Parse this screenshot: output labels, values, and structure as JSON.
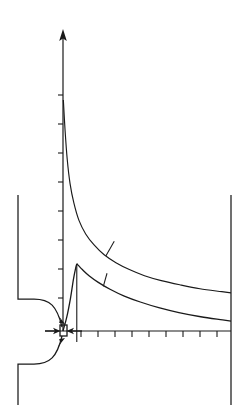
{
  "figure": {
    "title": "",
    "background_color": "#ffffff",
    "ink_color": "#1a1a1a",
    "width": 251,
    "height": 419
  },
  "chart_data": {
    "type": "line",
    "title": "",
    "subtitle": "",
    "xlabel": "",
    "ylabel": "",
    "xlim": [
      0,
      10
    ],
    "ylim": [
      0,
      10
    ],
    "grid": false,
    "legend_position": "none",
    "axes": {
      "origin_px": [
        63,
        331
      ],
      "y_axis": {
        "arrow": true,
        "tick_count": 8,
        "tick_values": [
          1,
          2,
          3,
          4,
          5,
          6,
          7,
          8
        ],
        "tick_labels": []
      },
      "x_axis": {
        "arrow": false,
        "tick_count": 9,
        "tick_values": [
          1,
          2,
          3,
          4,
          5,
          6,
          7,
          8,
          9
        ],
        "tick_labels": []
      }
    },
    "series": [
      {
        "name": "upper-curve",
        "style": "solid",
        "points": [
          [
            0.02,
            9.4
          ],
          [
            0.12,
            8.2
          ],
          [
            0.25,
            7.0
          ],
          [
            0.42,
            6.0
          ],
          [
            0.65,
            5.2
          ],
          [
            0.95,
            4.5
          ],
          [
            1.35,
            3.95
          ],
          [
            1.85,
            3.5
          ],
          [
            2.45,
            3.1
          ],
          [
            3.15,
            2.78
          ],
          [
            3.95,
            2.5
          ],
          [
            4.85,
            2.25
          ],
          [
            5.85,
            2.05
          ],
          [
            6.95,
            1.88
          ],
          [
            8.15,
            1.72
          ],
          [
            9.45,
            1.6
          ],
          [
            10.0,
            1.55
          ]
        ],
        "leader_tick": {
          "at": [
            2.55,
            3.05
          ],
          "to": [
            3.05,
            3.65
          ]
        }
      },
      {
        "name": "lower-curve",
        "style": "solid",
        "points": [
          [
            0.0,
            0.0
          ],
          [
            0.22,
            0.55
          ],
          [
            0.45,
            1.35
          ],
          [
            0.62,
            2.1
          ],
          [
            0.75,
            2.55
          ],
          [
            0.82,
            2.72
          ],
          [
            0.9,
            2.68
          ],
          [
            1.15,
            2.5
          ],
          [
            1.55,
            2.25
          ],
          [
            2.1,
            1.98
          ],
          [
            2.8,
            1.7
          ],
          [
            3.65,
            1.42
          ],
          [
            4.6,
            1.18
          ],
          [
            5.7,
            0.95
          ],
          [
            6.9,
            0.75
          ],
          [
            8.2,
            0.58
          ],
          [
            9.5,
            0.45
          ],
          [
            10.0,
            0.4
          ]
        ],
        "leader_tick": {
          "at": [
            2.4,
            1.82
          ],
          "to": [
            2.62,
            2.35
          ]
        },
        "peak_dropline": {
          "x": 0.82,
          "from_y": 2.72,
          "to_y": -0.45
        }
      }
    ],
    "annotations": [
      {
        "name": "orifice-marker",
        "shape": "small-rectangle",
        "at": [
          0.0,
          0.0
        ],
        "note": "small open rectangle at origin marking orifice throat"
      },
      {
        "name": "inflow-arrow-left",
        "shape": "arrow",
        "direction": "right",
        "note": "horizontal arrow pointing toward origin from left"
      },
      {
        "name": "inflow-arrow-right",
        "shape": "arrow",
        "direction": "left",
        "note": "horizontal arrow pointing toward origin from right"
      },
      {
        "name": "diagonal-arrow-upper",
        "shape": "arrow",
        "note": "short arrow from upper-left into orifice"
      },
      {
        "name": "diagonal-arrow-lower",
        "shape": "arrow",
        "note": "short arrow from lower-left into orifice"
      }
    ],
    "geometry": [
      {
        "name": "nozzle-upper-wall",
        "note": "vertical wall descending then rounded fillet converging to orifice"
      },
      {
        "name": "nozzle-lower-wall",
        "note": "rounded fillet diverging from orifice then vertical wall descending"
      },
      {
        "name": "downstream-wall",
        "note": "vertical wall at right edge of domain"
      }
    ]
  }
}
